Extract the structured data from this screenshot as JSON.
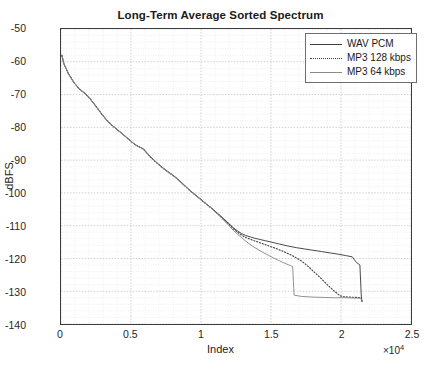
{
  "chart_data": {
    "type": "line",
    "title": "Long-Term Average Sorted Spectrum",
    "xlabel": "Index",
    "ylabel": "dBFS",
    "x_exponent": "×10",
    "x_exponent_power": "4",
    "x_scale_factor": 10000,
    "xlim": [
      0,
      25000
    ],
    "ylim": [
      -140,
      -50
    ],
    "xticks": [
      0,
      5000,
      10000,
      15000,
      20000,
      25000
    ],
    "xticklabels": [
      "0",
      "0.5",
      "1",
      "1.5",
      "2",
      "2.5"
    ],
    "yticks": [
      -50,
      -60,
      -70,
      -80,
      -90,
      -100,
      -110,
      -120,
      -130,
      -140
    ],
    "yticklabels": [
      "-50",
      "-60",
      "-70",
      "-80",
      "-90",
      "-100",
      "-110",
      "-120",
      "-130",
      "-140"
    ],
    "grid": true,
    "minor_grid": true,
    "legend_position": "top-right",
    "series": [
      {
        "name": "WAV PCM",
        "style": "solid",
        "color": "#3f3f3f",
        "x": [
          60,
          200,
          500,
          900,
          1300,
          1700,
          2100,
          2500,
          2900,
          3300,
          3700,
          4100,
          4500,
          4900,
          5300,
          5600,
          5900,
          6100,
          6400,
          6800,
          7200,
          7600,
          8000,
          8400,
          8800,
          9200,
          9600,
          10000,
          10400,
          10800,
          11200,
          11600,
          12000,
          12300,
          12600,
          12900,
          13200,
          13500,
          13800,
          14200,
          14600,
          15000,
          15600,
          16200,
          16800,
          17400,
          18000,
          18600,
          19200,
          19800,
          20300,
          20800,
          21100,
          21350,
          21450,
          21500
        ],
        "y": [
          -58.0,
          -60.5,
          -63.4,
          -66.2,
          -68.3,
          -69.6,
          -71.4,
          -73.6,
          -75.9,
          -78.0,
          -79.6,
          -81.0,
          -82.4,
          -83.9,
          -85.3,
          -86.0,
          -86.6,
          -87.6,
          -89.0,
          -90.6,
          -92.1,
          -93.4,
          -94.6,
          -96.0,
          -97.6,
          -99.2,
          -100.6,
          -102.0,
          -103.4,
          -104.8,
          -106.3,
          -107.8,
          -109.4,
          -110.6,
          -111.6,
          -112.4,
          -113.0,
          -113.4,
          -113.8,
          -114.2,
          -114.6,
          -115.0,
          -115.6,
          -116.2,
          -116.7,
          -117.1,
          -117.5,
          -117.9,
          -118.3,
          -118.7,
          -119.1,
          -119.5,
          -121.2,
          -122.0,
          -131.5,
          -133.0
        ]
      },
      {
        "name": "MP3 128 kbps",
        "style": "dotted",
        "color": "#3f3f3f",
        "x": [
          60,
          200,
          500,
          900,
          1300,
          1700,
          2100,
          2500,
          2900,
          3300,
          3700,
          4100,
          4500,
          4900,
          5300,
          5600,
          5900,
          6100,
          6400,
          6800,
          7200,
          7600,
          8000,
          8400,
          8800,
          9200,
          9600,
          10000,
          10400,
          10800,
          11200,
          11600,
          12000,
          12300,
          12600,
          12900,
          13200,
          13500,
          13800,
          14200,
          14600,
          15000,
          15500,
          16000,
          16500,
          17000,
          17400,
          17800,
          18200,
          18600,
          19000,
          19400,
          19700,
          19950,
          20200,
          20700,
          21200,
          21450,
          21500
        ],
        "y": [
          -58.0,
          -60.5,
          -63.4,
          -66.2,
          -68.3,
          -69.6,
          -71.4,
          -73.6,
          -75.9,
          -78.0,
          -79.6,
          -81.0,
          -82.4,
          -83.9,
          -85.3,
          -86.0,
          -86.7,
          -87.7,
          -89.1,
          -90.7,
          -92.2,
          -93.5,
          -94.7,
          -96.1,
          -97.7,
          -99.3,
          -100.7,
          -102.1,
          -103.5,
          -104.9,
          -106.4,
          -108.0,
          -109.6,
          -110.9,
          -112.0,
          -112.9,
          -113.6,
          -114.1,
          -114.6,
          -115.2,
          -115.8,
          -116.4,
          -117.2,
          -118.1,
          -119.1,
          -120.3,
          -121.5,
          -123.0,
          -124.6,
          -126.2,
          -127.9,
          -129.5,
          -130.6,
          -131.4,
          -131.7,
          -131.8,
          -131.9,
          -132.0,
          -133.2
        ]
      },
      {
        "name": "MP3 64 kbps",
        "style": "solid",
        "color": "#8a8a8a",
        "x": [
          60,
          200,
          500,
          900,
          1300,
          1700,
          2100,
          2500,
          2900,
          3300,
          3700,
          4100,
          4500,
          4900,
          5300,
          5600,
          5900,
          6100,
          6400,
          6800,
          7200,
          7600,
          8000,
          8400,
          8800,
          9200,
          9600,
          10000,
          10400,
          10800,
          11200,
          11600,
          12000,
          12300,
          12600,
          12900,
          13100,
          13400,
          13700,
          14000,
          14400,
          14800,
          15200,
          15600,
          16000,
          16400,
          16550,
          16600,
          16650,
          17200,
          18000,
          18800,
          19600,
          20400,
          21000,
          21400,
          21450,
          21500
        ],
        "y": [
          -58.0,
          -60.5,
          -63.4,
          -66.2,
          -68.3,
          -69.6,
          -71.4,
          -73.6,
          -75.9,
          -78.0,
          -79.6,
          -81.0,
          -82.4,
          -83.9,
          -85.3,
          -86.0,
          -86.7,
          -87.7,
          -89.1,
          -90.7,
          -92.2,
          -93.5,
          -94.7,
          -96.1,
          -97.7,
          -99.3,
          -100.7,
          -102.1,
          -103.5,
          -104.9,
          -106.5,
          -108.2,
          -110.0,
          -111.4,
          -112.6,
          -113.6,
          -114.4,
          -115.4,
          -116.3,
          -117.1,
          -118.1,
          -119.0,
          -119.9,
          -120.7,
          -121.5,
          -122.2,
          -122.5,
          -127.0,
          -131.2,
          -131.6,
          -131.8,
          -131.9,
          -132.0,
          -132.0,
          -132.1,
          -132.1,
          -132.5,
          -133.0
        ]
      }
    ]
  },
  "legend": {
    "entries": [
      {
        "label": "WAV PCM"
      },
      {
        "label": "MP3 128 kbps"
      },
      {
        "label": "MP3 64 kbps"
      }
    ]
  }
}
